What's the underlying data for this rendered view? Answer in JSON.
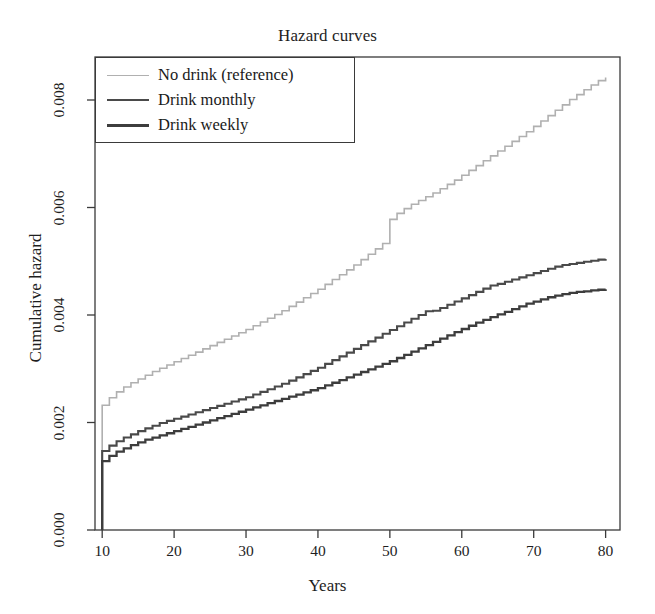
{
  "chart_data": {
    "type": "line",
    "title": "Hazard curves",
    "xlabel": "Years",
    "ylabel": "Cumulative hazard",
    "xlim": [
      9,
      82
    ],
    "ylim": [
      0.0,
      0.0088
    ],
    "xticks": [
      10,
      20,
      30,
      40,
      50,
      60,
      70,
      80
    ],
    "xtick_labels": [
      "10",
      "20",
      "30",
      "40",
      "50",
      "60",
      "70",
      "80"
    ],
    "yticks": [
      0.0,
      0.002,
      0.004,
      0.006,
      0.008
    ],
    "ytick_labels": [
      "0.000",
      "0.002",
      "0.004",
      "0.006",
      "0.008"
    ],
    "grid": false,
    "legend_position": "top-left",
    "step_style": "post",
    "series": [
      {
        "name": "No drink (reference)",
        "color": "#b0b0b0",
        "width": 1.6,
        "x": [
          10,
          10,
          11,
          12,
          13,
          14,
          15,
          16,
          17,
          18,
          19,
          20,
          21,
          22,
          23,
          24,
          25,
          26,
          27,
          28,
          29,
          30,
          31,
          32,
          33,
          34,
          35,
          36,
          37,
          38,
          39,
          40,
          41,
          42,
          43,
          44,
          45,
          46,
          47,
          48,
          49,
          50,
          50,
          51,
          52,
          53,
          54,
          55,
          56,
          57,
          58,
          59,
          60,
          61,
          62,
          63,
          64,
          65,
          66,
          67,
          68,
          69,
          70,
          71,
          72,
          73,
          74,
          75,
          76,
          77,
          78,
          79,
          80
        ],
        "y": [
          0.0,
          0.00232,
          0.00246,
          0.00257,
          0.00266,
          0.00274,
          0.00281,
          0.00288,
          0.00295,
          0.00301,
          0.00307,
          0.00313,
          0.00319,
          0.00325,
          0.00331,
          0.00337,
          0.00343,
          0.00349,
          0.00355,
          0.00361,
          0.00367,
          0.00373,
          0.0038,
          0.00387,
          0.00394,
          0.00401,
          0.00408,
          0.00416,
          0.00424,
          0.00432,
          0.0044,
          0.00448,
          0.00457,
          0.00466,
          0.00475,
          0.00484,
          0.00493,
          0.00503,
          0.00513,
          0.00523,
          0.00533,
          0.00543,
          0.00578,
          0.00589,
          0.00598,
          0.00606,
          0.00613,
          0.0062,
          0.00627,
          0.00635,
          0.00643,
          0.00651,
          0.0066,
          0.00669,
          0.00678,
          0.00687,
          0.00696,
          0.00705,
          0.00714,
          0.00723,
          0.00732,
          0.00741,
          0.00751,
          0.00761,
          0.00771,
          0.00781,
          0.00791,
          0.00801,
          0.0081,
          0.00819,
          0.00828,
          0.00836,
          0.00842
        ]
      },
      {
        "name": "Drink monthly",
        "color": "#4a4a4a",
        "width": 2.1,
        "x": [
          10,
          10,
          11,
          12,
          13,
          14,
          15,
          16,
          17,
          18,
          19,
          20,
          21,
          22,
          23,
          24,
          25,
          26,
          27,
          28,
          29,
          30,
          31,
          32,
          33,
          34,
          35,
          36,
          37,
          38,
          39,
          40,
          41,
          42,
          43,
          44,
          45,
          46,
          47,
          48,
          49,
          50,
          51,
          52,
          53,
          54,
          55,
          56,
          57,
          58,
          59,
          60,
          61,
          62,
          63,
          64,
          65,
          66,
          67,
          68,
          69,
          70,
          71,
          72,
          73,
          74,
          75,
          76,
          77,
          78,
          79,
          80
        ],
        "y": [
          0.0,
          0.00147,
          0.00157,
          0.00165,
          0.00172,
          0.00178,
          0.00184,
          0.00189,
          0.00194,
          0.00199,
          0.00203,
          0.00207,
          0.00211,
          0.00215,
          0.00219,
          0.00223,
          0.00227,
          0.00231,
          0.00235,
          0.00239,
          0.00243,
          0.00247,
          0.00252,
          0.00257,
          0.00262,
          0.00267,
          0.00272,
          0.00278,
          0.00284,
          0.0029,
          0.00296,
          0.00302,
          0.00309,
          0.00316,
          0.00323,
          0.0033,
          0.00337,
          0.00344,
          0.00351,
          0.00358,
          0.00365,
          0.00372,
          0.00379,
          0.00386,
          0.00393,
          0.004,
          0.00407,
          0.00408,
          0.00413,
          0.00419,
          0.00425,
          0.00431,
          0.00437,
          0.00443,
          0.00449,
          0.00455,
          0.00458,
          0.00462,
          0.00466,
          0.0047,
          0.00474,
          0.00478,
          0.00482,
          0.00486,
          0.0049,
          0.00493,
          0.00495,
          0.00497,
          0.00499,
          0.00501,
          0.00503,
          0.00504
        ]
      },
      {
        "name": "Drink weekly",
        "color": "#3d3d3d",
        "width": 2.3,
        "x": [
          10,
          10,
          11,
          12,
          13,
          14,
          15,
          16,
          17,
          18,
          19,
          20,
          21,
          22,
          23,
          24,
          25,
          26,
          27,
          28,
          29,
          30,
          31,
          32,
          33,
          34,
          35,
          36,
          37,
          38,
          39,
          40,
          41,
          42,
          43,
          44,
          45,
          46,
          47,
          48,
          49,
          50,
          51,
          52,
          53,
          54,
          55,
          56,
          57,
          58,
          59,
          60,
          61,
          62,
          63,
          64,
          65,
          66,
          67,
          68,
          69,
          70,
          71,
          72,
          73,
          74,
          75,
          76,
          77,
          78,
          79,
          80
        ],
        "y": [
          0.0,
          0.00128,
          0.00138,
          0.00146,
          0.00152,
          0.00158,
          0.00163,
          0.00168,
          0.00172,
          0.00176,
          0.0018,
          0.00184,
          0.00188,
          0.00192,
          0.00196,
          0.002,
          0.00204,
          0.00208,
          0.00212,
          0.00216,
          0.0022,
          0.00224,
          0.00228,
          0.00232,
          0.00236,
          0.0024,
          0.00244,
          0.00248,
          0.00252,
          0.00256,
          0.0026,
          0.00264,
          0.00269,
          0.00274,
          0.00279,
          0.00284,
          0.00289,
          0.00294,
          0.00299,
          0.00304,
          0.00309,
          0.00314,
          0.0032,
          0.00326,
          0.00332,
          0.00338,
          0.00344,
          0.0035,
          0.00356,
          0.00362,
          0.00368,
          0.00374,
          0.0038,
          0.00386,
          0.00391,
          0.00396,
          0.00401,
          0.00406,
          0.00411,
          0.00416,
          0.00421,
          0.00425,
          0.00429,
          0.00433,
          0.00436,
          0.00439,
          0.00441,
          0.00443,
          0.00444,
          0.00446,
          0.00447,
          0.00448
        ]
      }
    ]
  },
  "legend": {
    "entries": [
      {
        "label": "No drink (reference)",
        "color": "#b0b0b0"
      },
      {
        "label": "Drink monthly",
        "color": "#4a4a4a"
      },
      {
        "label": "Drink weekly",
        "color": "#3d3d3d"
      }
    ]
  },
  "axis": {
    "frame_color": "#3a3a3a"
  }
}
